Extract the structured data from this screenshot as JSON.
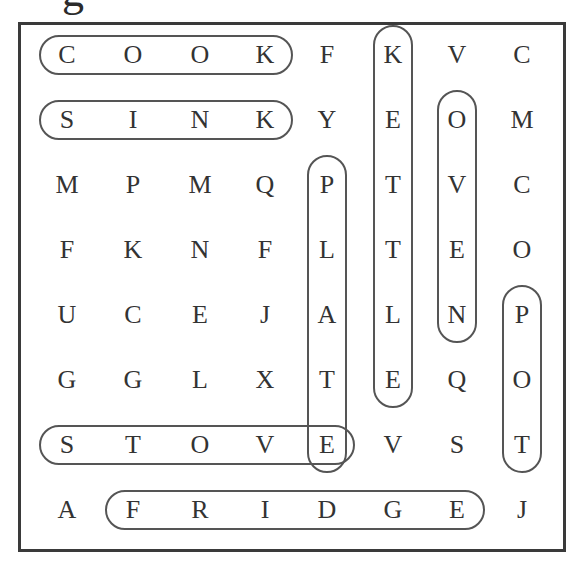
{
  "heading_fragment": "g",
  "grid": {
    "rows": [
      [
        "C",
        "O",
        "O",
        "K",
        "F",
        "K",
        "V",
        "C"
      ],
      [
        "S",
        "I",
        "N",
        "K",
        "Y",
        "E",
        "O",
        "M"
      ],
      [
        "M",
        "P",
        "M",
        "Q",
        "P",
        "T",
        "V",
        "C"
      ],
      [
        "F",
        "K",
        "N",
        "F",
        "L",
        "T",
        "E",
        "O"
      ],
      [
        "U",
        "C",
        "E",
        "J",
        "A",
        "L",
        "N",
        "P"
      ],
      [
        "G",
        "G",
        "L",
        "X",
        "T",
        "E",
        "Q",
        "O"
      ],
      [
        "S",
        "T",
        "O",
        "V",
        "E",
        "V",
        "S",
        "T"
      ],
      [
        "A",
        "F",
        "R",
        "I",
        "D",
        "G",
        "E",
        "J"
      ]
    ]
  },
  "found_words": [
    {
      "word": "COOK",
      "direction": "horizontal",
      "row": 0,
      "start_col": 0,
      "end_col": 3
    },
    {
      "word": "SINK",
      "direction": "horizontal",
      "row": 1,
      "start_col": 0,
      "end_col": 3
    },
    {
      "word": "STOVE",
      "direction": "horizontal",
      "row": 6,
      "start_col": 0,
      "end_col": 4
    },
    {
      "word": "FRIDGE",
      "direction": "horizontal",
      "row": 7,
      "start_col": 1,
      "end_col": 6
    },
    {
      "word": "KETTLE",
      "direction": "vertical",
      "col": 5,
      "start_row": 0,
      "end_row": 5
    },
    {
      "word": "OVEN",
      "direction": "vertical",
      "col": 6,
      "start_row": 1,
      "end_row": 4
    },
    {
      "word": "PLATE",
      "direction": "vertical",
      "col": 4,
      "start_row": 2,
      "end_row": 6
    },
    {
      "word": "POT",
      "direction": "vertical",
      "col": 7,
      "start_row": 4,
      "end_row": 6
    }
  ],
  "colors": {
    "border": "#3a3a3a",
    "ring": "#555555",
    "text": "#333333"
  }
}
